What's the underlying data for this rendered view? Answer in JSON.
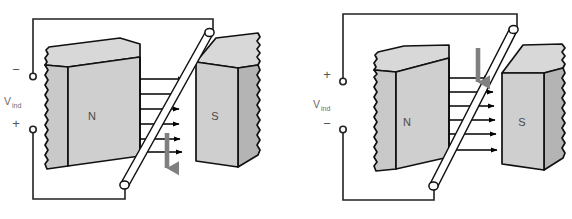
{
  "figure": {
    "panel_count": 2
  },
  "colors": {
    "magnet_top_face": "#d8d8d8",
    "magnet_front_face": "#c9c9c9",
    "magnet_side_face": "#b4b4b4",
    "outline": "#111111",
    "field_arrow": "#000000",
    "motion_arrow": "#808080",
    "rod_fill": "#ffffff",
    "wire": "#222222",
    "text": "#555555",
    "background": "#ffffff"
  },
  "panels": [
    {
      "id": "left",
      "name": "panel-downward-motion",
      "voltage_label": "V",
      "voltage_subscript": "ind",
      "top_terminal_sign": "−",
      "bottom_terminal_sign": "+",
      "north_pole_label": "N",
      "south_pole_label": "S",
      "motion_direction": "down",
      "motion_arrow_name": "motion-arrow-down",
      "field_line_count": 6,
      "field_direction": "left-to-right"
    },
    {
      "id": "right",
      "name": "panel-upward-motion",
      "voltage_label": "V",
      "voltage_subscript": "ind",
      "top_terminal_sign": "+",
      "bottom_terminal_sign": "−",
      "north_pole_label": "N",
      "south_pole_label": "S",
      "motion_direction": "up",
      "motion_arrow_name": "motion-arrow-up",
      "field_line_count": 6,
      "field_direction": "left-to-right"
    }
  ]
}
